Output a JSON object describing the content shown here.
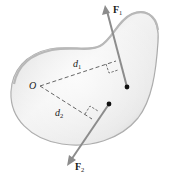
{
  "diagram": {
    "type": "rigid-body-moments",
    "labels": {
      "origin": "O",
      "d1": {
        "main": "d",
        "sub": "1"
      },
      "d2": {
        "main": "d",
        "sub": "2"
      },
      "F1": {
        "main": "F",
        "sub": "1"
      },
      "F2": {
        "main": "F",
        "sub": "2"
      }
    },
    "colors": {
      "body_fill_light": "#f2f2f2",
      "body_fill_dark": "#c9c9c9",
      "body_edge": "#a6a6a6",
      "arrow": "#8c8c8c",
      "dash": "#555555",
      "point": "#111111",
      "text": "#1a1a1a"
    }
  }
}
